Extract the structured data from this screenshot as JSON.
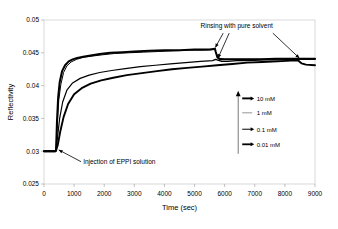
{
  "chart_data": {
    "type": "line",
    "title": "",
    "xlabel": "Time (sec)",
    "ylabel": "Reflectivity",
    "xlim": [
      0,
      9000
    ],
    "ylim": [
      0.025,
      0.05
    ],
    "xticks": [
      0,
      1000,
      2000,
      3000,
      4000,
      5000,
      6000,
      7000,
      8000,
      9000
    ],
    "xtick_labels": [
      "0",
      "1000",
      "2000",
      "3000",
      "4000",
      "5000",
      "6000",
      "7000",
      "8000",
      "9000"
    ],
    "yticks": [
      0.025,
      0.03,
      0.035,
      0.04,
      0.045,
      0.05
    ],
    "ytick_labels": [
      "0.025",
      "0.03",
      "0.035",
      "0.04",
      "0.045",
      "0.05"
    ],
    "grid": false,
    "legend_position": "inside-right",
    "series": [
      {
        "name": "10 mM",
        "color": "#000000",
        "marker": "line-arrow",
        "x": [
          0,
          100,
          200,
          300,
          380,
          400,
          430,
          470,
          520,
          600,
          700,
          820,
          950,
          1100,
          1300,
          1550,
          1850,
          2200,
          2600,
          3000,
          3500,
          4000,
          4500,
          5000,
          5500,
          5680,
          5700,
          5760,
          5850,
          6000,
          6300,
          6700,
          7200,
          7700,
          8200,
          8450,
          8500,
          8600,
          8800,
          9000
        ],
        "y": [
          0.03,
          0.03,
          0.03,
          0.03,
          0.03,
          0.0301,
          0.0345,
          0.0382,
          0.0405,
          0.0422,
          0.0431,
          0.0437,
          0.044,
          0.0442,
          0.0444,
          0.0446,
          0.0448,
          0.045,
          0.0451,
          0.0452,
          0.0453,
          0.0454,
          0.0454,
          0.0455,
          0.0455,
          0.0456,
          0.0452,
          0.0443,
          0.044,
          0.044,
          0.044,
          0.044,
          0.044,
          0.0441,
          0.0441,
          0.0441,
          0.0441,
          0.0441,
          0.0441,
          0.0441
        ]
      },
      {
        "name": "1 mM",
        "color": "#000000",
        "marker": "line",
        "x": [
          0,
          200,
          380,
          400,
          440,
          490,
          560,
          650,
          760,
          900,
          1080,
          1300,
          1600,
          1950,
          2350,
          2800,
          3300,
          3800,
          4300,
          4800,
          5300,
          5680,
          5700,
          5800,
          6000,
          6300,
          6700,
          7200,
          7700,
          8200,
          8450,
          8600,
          8800,
          9000
        ],
        "y": [
          0.03,
          0.03,
          0.03,
          0.0301,
          0.034,
          0.0378,
          0.0402,
          0.042,
          0.043,
          0.0436,
          0.044,
          0.0443,
          0.0445,
          0.0447,
          0.0449,
          0.045,
          0.0451,
          0.0452,
          0.0453,
          0.0454,
          0.0454,
          0.0455,
          0.0451,
          0.0442,
          0.044,
          0.044,
          0.044,
          0.044,
          0.044,
          0.0441,
          0.0441,
          0.0441,
          0.0441,
          0.0441
        ]
      },
      {
        "name": "0.1 mM",
        "color": "#000000",
        "marker": "line-arrow-small",
        "x": [
          0,
          200,
          380,
          400,
          450,
          520,
          620,
          760,
          950,
          1200,
          1500,
          1850,
          2250,
          2700,
          3200,
          3700,
          4200,
          4700,
          5200,
          5600,
          5700,
          5900,
          6100,
          6400,
          6800,
          7300,
          7800,
          8200,
          8450,
          8550,
          8700,
          9000
        ],
        "y": [
          0.03,
          0.03,
          0.03,
          0.0301,
          0.0322,
          0.035,
          0.0375,
          0.0393,
          0.0404,
          0.0411,
          0.0416,
          0.042,
          0.0423,
          0.0426,
          0.0429,
          0.0431,
          0.0433,
          0.0435,
          0.0437,
          0.0438,
          0.044,
          0.0437,
          0.0437,
          0.0438,
          0.0438,
          0.0439,
          0.0439,
          0.044,
          0.044,
          0.044,
          0.044,
          0.044
        ]
      },
      {
        "name": "0.01 mM",
        "color": "#000000",
        "marker": "line-arrow-thick",
        "x": [
          0,
          200,
          380,
          400,
          460,
          540,
          650,
          800,
          1000,
          1250,
          1550,
          1900,
          2300,
          2750,
          3250,
          3750,
          4250,
          4750,
          5250,
          5750,
          6250,
          6750,
          7250,
          7750,
          8200,
          8450,
          8550,
          8700,
          9000
        ],
        "y": [
          0.03,
          0.03,
          0.03,
          0.0301,
          0.031,
          0.033,
          0.0352,
          0.0372,
          0.0387,
          0.0396,
          0.0403,
          0.0408,
          0.0412,
          0.0416,
          0.0419,
          0.0422,
          0.0425,
          0.0427,
          0.0429,
          0.0431,
          0.0433,
          0.0435,
          0.0436,
          0.0437,
          0.0438,
          0.0438,
          0.0434,
          0.0432,
          0.0431
        ]
      }
    ],
    "annotations": [
      {
        "text": "Rinsing with pure solvent",
        "x": 6400,
        "y": 0.0488
      },
      {
        "text": "Injection of EPPI solution",
        "x": 1300,
        "y": 0.0281
      }
    ]
  },
  "legend": {
    "items": [
      {
        "label": "10 mM"
      },
      {
        "label": "1 mM"
      },
      {
        "label": "0.1 mM"
      },
      {
        "label": "0.01 mM"
      }
    ]
  },
  "axes": {
    "x_title": "Time (sec)",
    "y_title": "Reflectivity"
  },
  "annotations": {
    "rinsing": "Rinsing with pure solvent",
    "injection": "Injection of EPPI solution"
  }
}
